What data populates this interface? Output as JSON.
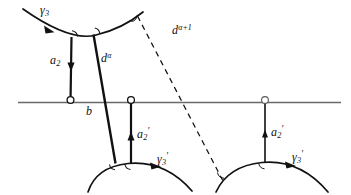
{
  "figure": {
    "background_color": "#ffffff",
    "stroke_color": "#111111",
    "thin_stroke_color": "#5a5a5a",
    "width": 351,
    "height": 195
  },
  "labels": {
    "gamma_3_top": {
      "base": "γ",
      "sub": "3",
      "prime": ""
    },
    "gamma_3_prime_left": {
      "base": "γ",
      "sub": "3",
      "prime": "′"
    },
    "gamma_3_prime_right": {
      "base": "γ",
      "sub": "3",
      "prime": "′"
    },
    "a2_top": {
      "base": "a",
      "sub": "2",
      "prime": ""
    },
    "a2_prime_left": {
      "base": "a",
      "sub": "2",
      "prime": "′"
    },
    "a2_prime_right": {
      "base": "a",
      "sub": "2",
      "prime": "′"
    },
    "d_alpha": {
      "base": "d",
      "sup": "α"
    },
    "d_alpha_plus_1": {
      "base": "d",
      "sup": "α+1"
    },
    "b": {
      "base": "b"
    }
  },
  "geometry": {
    "top_arc": {
      "name": "gamma-3-arc",
      "shape": "concave-up",
      "stroke": "#111111"
    },
    "bottom_left_arc": {
      "name": "gamma-3-prime-arc-left",
      "shape": "convex-up",
      "stroke": "#111111"
    },
    "bottom_right_arc": {
      "name": "gamma-3-prime-arc-right",
      "shape": "convex-up",
      "stroke": "#111111"
    },
    "baseline": {
      "name": "horizontal-baseline",
      "stroke": "#5a5a5a"
    },
    "segment_a2": {
      "name": "segment-a2",
      "style": "solid"
    },
    "segment_d_alpha": {
      "name": "segment-d-alpha",
      "style": "solid"
    },
    "segment_d_alpha_1": {
      "name": "segment-d-alpha-plus-1",
      "style": "dashed"
    },
    "segment_a2_prime_l": {
      "name": "segment-a2-prime-left",
      "style": "solid"
    },
    "segment_a2_prime_r": {
      "name": "segment-a2-prime-right",
      "style": "solid"
    }
  }
}
